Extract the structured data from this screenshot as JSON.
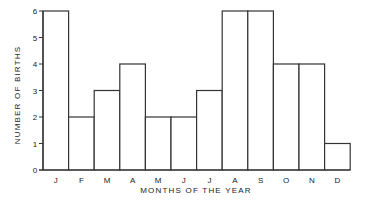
{
  "chart_data": {
    "type": "bar",
    "title": "",
    "xlabel": "MONTHS OF THE YEAR",
    "ylabel": "NUMBER OF BIRTHS",
    "categories": [
      "J",
      "F",
      "M",
      "A",
      "M",
      "J",
      "J",
      "A",
      "S",
      "O",
      "N",
      "D"
    ],
    "values": [
      6,
      2,
      3,
      4,
      2,
      2,
      3,
      6,
      6,
      4,
      4,
      1
    ],
    "ylim": [
      0,
      6
    ],
    "yticks": [
      0,
      1,
      2,
      3,
      4,
      5,
      6
    ],
    "grid": false,
    "legend": null
  },
  "style": {
    "bar_fill": "#ffffff",
    "bar_stroke": "#333333",
    "axis_color": "#333333",
    "text_color": "#222222"
  }
}
